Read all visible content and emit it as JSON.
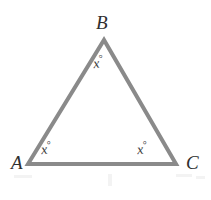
{
  "figure": {
    "kind": "geometry-diagram",
    "shape": "triangle",
    "background_color": "#ffffff",
    "stroke_color": "#8a8a8a",
    "stroke_width": 4,
    "label_color": "#2f2f2f"
  },
  "vertices": {
    "B": {
      "label": "B",
      "x": 104,
      "y": 40
    },
    "A": {
      "label": "A",
      "x": 28,
      "y": 164
    },
    "C": {
      "label": "C",
      "x": 176,
      "y": 164
    }
  },
  "angles": {
    "B": {
      "value": "x",
      "degree_symbol": "°"
    },
    "A": {
      "value": "x",
      "degree_symbol": "°"
    },
    "C": {
      "value": "x",
      "degree_symbol": "°"
    }
  },
  "chart_data": {
    "type": "diagram",
    "title": "",
    "shape": "triangle",
    "vertex_labels": [
      "A",
      "B",
      "C"
    ],
    "vertex_points": [
      [
        28,
        164
      ],
      [
        104,
        40
      ],
      [
        176,
        164
      ]
    ],
    "angle_labels": [
      "x°",
      "x°",
      "x°"
    ],
    "angle_label_points": [
      [
        49,
        147
      ],
      [
        101,
        61
      ],
      [
        145,
        147
      ]
    ]
  }
}
